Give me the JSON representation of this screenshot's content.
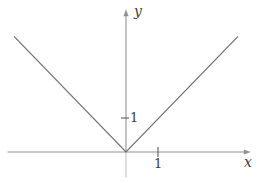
{
  "figure": {
    "background_color": "#ffffff",
    "axis_color": "#929292",
    "axis_below_origin_color": "#bcbcbc",
    "curve_color": "#6e6e6e",
    "tick_color": "#5a5a5a",
    "text_color": "#3d3d3d"
  },
  "chart_data": {
    "type": "line",
    "title": "",
    "xlabel": "x",
    "ylabel": "y",
    "series": [
      {
        "name": "y = |x|",
        "x": [
          -3.5,
          0,
          3.5
        ],
        "y": [
          3.4,
          0,
          3.4
        ]
      }
    ],
    "xticks": [
      {
        "value": 1,
        "label": "1"
      }
    ],
    "yticks": [
      {
        "value": 1,
        "label": "1"
      }
    ],
    "xlim": [
      -3.7,
      3.9
    ],
    "ylim": [
      -0.75,
      4.2
    ],
    "grid": false,
    "legend_position": "none"
  }
}
